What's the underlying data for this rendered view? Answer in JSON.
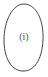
{
  "diagram": {
    "shape": "oval",
    "label": "(i)",
    "stroke_color": "#444444"
  }
}
